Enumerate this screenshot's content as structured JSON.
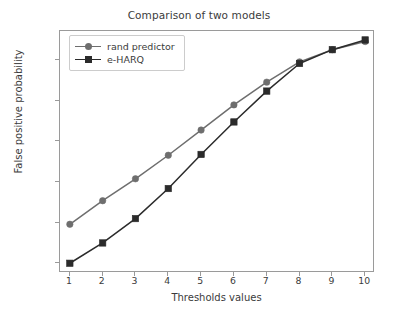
{
  "chart_data": {
    "type": "line",
    "title": "Comparison of two models",
    "xlabel": "Thresholds values",
    "ylabel": "False positive probability",
    "x": [
      1,
      2,
      3,
      4,
      5,
      6,
      7,
      8,
      9,
      10
    ],
    "xlim": [
      0.7,
      10.3
    ],
    "ylim": [
      0.088,
      0.386
    ],
    "xticks": [
      "1",
      "2",
      "3",
      "4",
      "5",
      "6",
      "7",
      "8",
      "9",
      "10"
    ],
    "xtick_values": [
      1,
      2,
      3,
      4,
      5,
      6,
      7,
      8,
      9,
      10
    ],
    "yticks": [
      "0.10",
      "0.15",
      "0.20",
      "0.25",
      "0.30",
      "0.35"
    ],
    "ytick_values": [
      0.1,
      0.15,
      0.2,
      0.25,
      0.3,
      0.35
    ],
    "grid": false,
    "legend_position": "upper left",
    "series": [
      {
        "name": "rand predictor",
        "color": "#6e6e6e",
        "marker": "circle",
        "values": [
          0.148,
          0.177,
          0.204,
          0.233,
          0.264,
          0.295,
          0.323,
          0.348,
          0.363,
          0.373
        ]
      },
      {
        "name": "e-HARQ",
        "color": "#2b2b2b",
        "marker": "square",
        "values": [
          0.1,
          0.125,
          0.155,
          0.192,
          0.234,
          0.274,
          0.312,
          0.346,
          0.363,
          0.375
        ]
      }
    ]
  },
  "legend": {
    "entries": [
      {
        "label": "rand predictor"
      },
      {
        "label": "e-HARQ"
      }
    ]
  },
  "axes": {
    "frame_color": "#9a9a9a",
    "text_color": "#3b3b3b"
  }
}
